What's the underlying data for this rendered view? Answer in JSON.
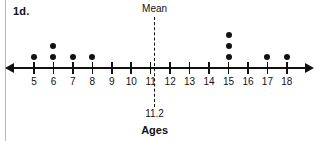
{
  "problem": {
    "label": "1d."
  },
  "chart_data": {
    "type": "scatter",
    "plot_kind": "dot-plot",
    "title": "",
    "xlabel": "Ages",
    "ylabel": "",
    "grid": false,
    "legend": null,
    "xlim": [
      5,
      18
    ],
    "categories": [
      5,
      6,
      7,
      8,
      9,
      10,
      11,
      12,
      13,
      14,
      15,
      16,
      17,
      18
    ],
    "tick_labels": [
      "5",
      "6",
      "7",
      "8",
      "9",
      "10",
      "11",
      "12",
      "13",
      "14",
      "15",
      "16",
      "17",
      "18"
    ],
    "values": [
      1,
      2,
      1,
      1,
      0,
      0,
      0,
      0,
      0,
      0,
      3,
      0,
      1,
      1
    ],
    "data_points": [
      5,
      6,
      6,
      7,
      8,
      15,
      15,
      15,
      17,
      18
    ],
    "annotations": [
      {
        "name": "mean",
        "label": "Mean",
        "value_label": "11.2",
        "value": 11.2,
        "style": "dashed-vertical-line"
      }
    ],
    "axis": {
      "left_arrow": true,
      "right_arrow": true
    }
  },
  "colors": {
    "ink": "#111111",
    "dot": "#111111",
    "gutter_rule": "#b8b8b8",
    "background": "#ffffff"
  }
}
